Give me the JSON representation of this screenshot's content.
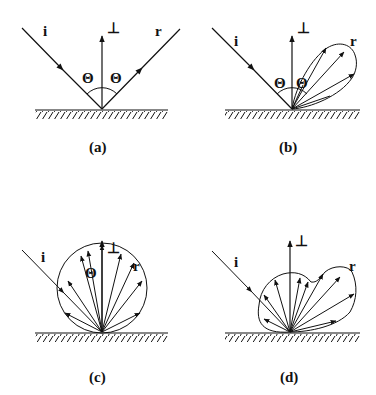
{
  "figure": {
    "panels": [
      {
        "id": "a",
        "caption": "(a)",
        "incident_label": "i",
        "reflected_label": "r",
        "normal_label": "⊥",
        "angle_labels": [
          "Θ",
          "Θ"
        ],
        "type": "specular reflection"
      },
      {
        "id": "b",
        "caption": "(b)",
        "incident_label": "i",
        "reflected_label": "r",
        "normal_label": "⊥",
        "angle_labels": [
          "Θ",
          "Θ"
        ],
        "type": "glossy (lobe) reflection"
      },
      {
        "id": "c",
        "caption": "(c)",
        "incident_label": "i",
        "reflected_label": "r",
        "normal_label": "⊥",
        "angle_labels": [
          "Θ"
        ],
        "type": "diffuse (Lambertian) reflection"
      },
      {
        "id": "d",
        "caption": "(d)",
        "incident_label": "i",
        "reflected_label": "r",
        "normal_label": "⊥",
        "angle_labels": [],
        "type": "mixed diffuse + glossy reflection"
      }
    ]
  }
}
